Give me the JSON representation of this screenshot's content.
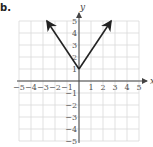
{
  "problem": {
    "label": "b."
  },
  "chart_data": {
    "type": "line",
    "title": "",
    "function": "y = 1.5|x| + 1",
    "xlabel": "x",
    "ylabel": "y",
    "xlim": [
      -5,
      5
    ],
    "ylim": [
      -5,
      5
    ],
    "grid": true,
    "x_ticks": [
      "-5",
      "-4",
      "-3",
      "-2",
      "-1",
      "1",
      "2",
      "3",
      "4",
      "5"
    ],
    "y_ticks": [
      "5",
      "4",
      "3",
      "2",
      "1",
      "-1",
      "-2",
      "-3",
      "-4",
      "-5"
    ],
    "series": [
      {
        "name": "absolute value graph",
        "points": [
          [
            -2.67,
            5
          ],
          [
            0,
            1
          ],
          [
            2.67,
            5
          ]
        ],
        "arrows": "both ends",
        "color": "#222222"
      }
    ],
    "vertex": [
      0,
      1
    ]
  },
  "colors": {
    "grid": "#d9d9d9",
    "axis": "#444444",
    "curve": "#222222"
  }
}
